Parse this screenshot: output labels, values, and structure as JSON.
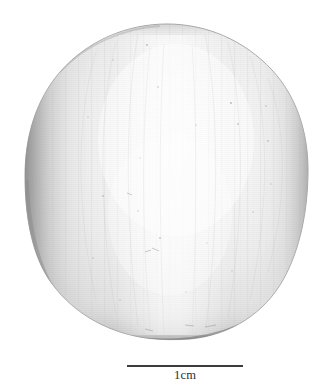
{
  "figure": {
    "caption_absent": "",
    "background_color": "#ffffff"
  },
  "specimen": {
    "name": "ovoid specimen",
    "description": "Large smooth ovoid object, pale greyish-white, photographed against a plain white background",
    "bounds": {
      "left": 25,
      "top": 24,
      "right": 308,
      "bottom": 340
    },
    "colors": {
      "highlight": "#f7f7f7",
      "midtone": "#dcdcdc",
      "shadow_left": "#969696",
      "shadow_right": "#b6b6b6",
      "rim_bottom": "#6d6d6d",
      "outline": "#8f8f8f"
    }
  },
  "scalebar": {
    "label": "1cm",
    "bar_color": "#3b3b3b",
    "bar_left_px": 127,
    "bar_right_px": 243,
    "bar_length_px": 116,
    "bar_thickness_px": 2.4,
    "represents": "1cm"
  }
}
